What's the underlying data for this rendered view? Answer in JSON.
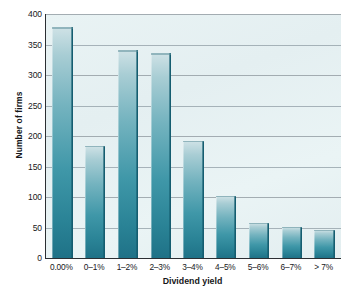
{
  "chart_data": {
    "type": "bar",
    "title": "",
    "xlabel": "Dividend yield",
    "ylabel": "Number of firms",
    "categories": [
      "0.00%",
      "0–1%",
      "1–2%",
      "2–3%",
      "3–4%",
      "4–5%",
      "5–6%",
      "6–7%",
      "> 7%"
    ],
    "values": [
      378,
      184,
      341,
      336,
      192,
      102,
      58,
      51,
      46
    ],
    "ylim": [
      0,
      400
    ],
    "yticks": [
      0,
      50,
      100,
      150,
      200,
      250,
      300,
      350,
      400
    ],
    "ytick_labels": [
      "0",
      "50",
      "100",
      "150",
      "200",
      "250",
      "300",
      "350",
      "400"
    ],
    "grid": "horizontal",
    "legend": "none",
    "bar_color": "#2a8396",
    "bar_color_top": "#cfe2e6",
    "bar_edge_color": "#155d70",
    "plot_background": "#e7f1f3",
    "axis_color": "#2b2f33",
    "gridline_color": "#8c9196"
  },
  "caption": ""
}
